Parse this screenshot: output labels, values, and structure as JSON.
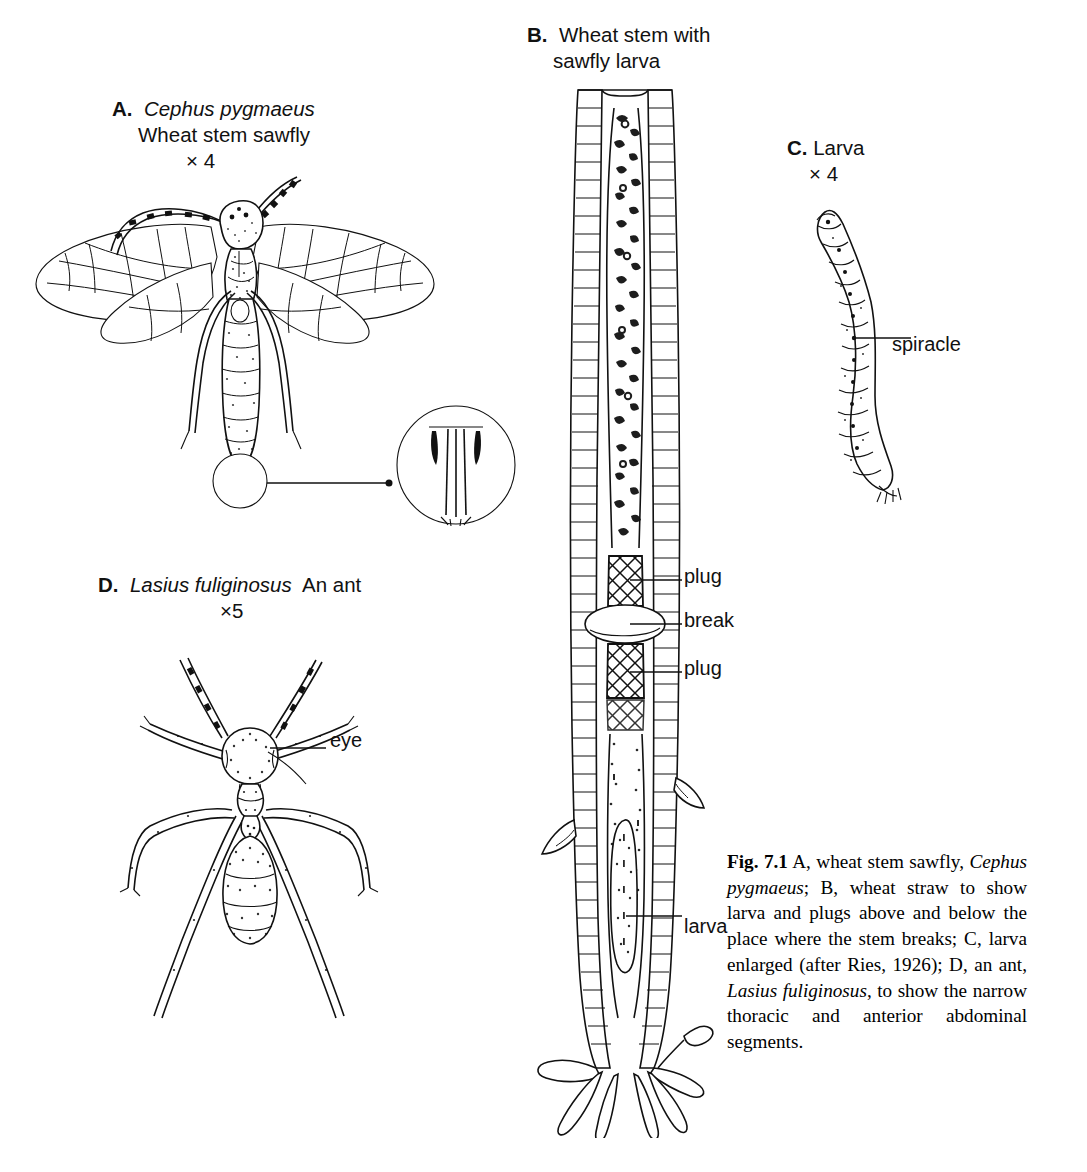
{
  "figure": {
    "number": "Fig. 7.1",
    "domain": "scientific-illustration",
    "page_background": "#ffffff",
    "ink_color": "#111111"
  },
  "panels": {
    "a": {
      "letter": "A.",
      "species": "Cephus pygmaeus",
      "common_name": "Wheat stem sawfly",
      "magnification": "× 4",
      "subject": "adult-sawfly-dorsal-view",
      "detail_circle": "ovipositor-enlargement"
    },
    "b": {
      "letter": "B.",
      "title_line1": "Wheat stem with",
      "title_line2": "sawfly larva",
      "subject": "wheat-straw-longitudinal-section",
      "callouts": [
        {
          "id": "plug-upper",
          "label": "plug"
        },
        {
          "id": "break",
          "label": "break"
        },
        {
          "id": "plug-lower",
          "label": "plug"
        },
        {
          "id": "larva",
          "label": "larva"
        }
      ]
    },
    "c": {
      "letter": "C.",
      "name": "Larva",
      "magnification": "× 4",
      "subject": "sawfly-larva-lateral-view",
      "callouts": [
        {
          "id": "spiracle",
          "label": "spiracle"
        }
      ]
    },
    "d": {
      "letter": "D.",
      "species": "Lasius fuliginosus",
      "common_name": "An ant",
      "magnification": "×5",
      "subject": "ant-dorsal-view",
      "callouts": [
        {
          "id": "eye",
          "label": "eye"
        }
      ]
    }
  },
  "caption": {
    "prefix": "Fig. 7.1",
    "segments": [
      {
        "text": " A, wheat stem sawfly, ",
        "style": "roman"
      },
      {
        "text": "Cephus pygmaeus",
        "style": "italic"
      },
      {
        "text": "; B, wheat straw to show larva and plugs above and below the place where the stem breaks; C, larva enlarged (after Ries, 1926); D, an ant, ",
        "style": "roman"
      },
      {
        "text": "Lasius fuliginosus",
        "style": "italic"
      },
      {
        "text": ", to show the narrow thoracic and anterior abdominal segments.",
        "style": "roman"
      }
    ],
    "plain_text": "Fig. 7.1 A, wheat stem sawfly, Cephus pygmaeus; B, wheat straw to show larva and plugs above and below the place where the stem breaks; C, larva enlarged (after Ries, 1926); D, an ant, Lasius fuliginosus, to show the narrow thoracic and anterior abdominal segments."
  }
}
